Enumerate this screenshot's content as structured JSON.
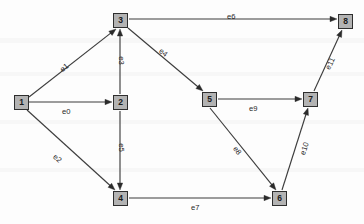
{
  "diagram": {
    "width": 364,
    "height": 224,
    "node_fill": "#b3b3b3",
    "node_stroke": "#2e2e2e",
    "edge_color": "#3d3d3d",
    "background": "#fdfdfd",
    "nodes": [
      {
        "id": "1",
        "label": "1",
        "x": 14,
        "y": 95
      },
      {
        "id": "2",
        "label": "2",
        "x": 113,
        "y": 95
      },
      {
        "id": "3",
        "label": "3",
        "x": 113,
        "y": 13
      },
      {
        "id": "4",
        "label": "4",
        "x": 113,
        "y": 191
      },
      {
        "id": "5",
        "label": "5",
        "x": 202,
        "y": 92
      },
      {
        "id": "6",
        "label": "6",
        "x": 272,
        "y": 191
      },
      {
        "id": "7",
        "label": "7",
        "x": 303,
        "y": 92
      },
      {
        "id": "8",
        "label": "8",
        "x": 338,
        "y": 14
      }
    ],
    "edges": [
      {
        "id": "e0",
        "label": "e0",
        "from": "1",
        "to": "2",
        "x1": 29,
        "y1": 102,
        "x2": 112,
        "y2": 102,
        "lx": 62,
        "ly": 107,
        "rot": 0
      },
      {
        "id": "e1",
        "label": "e1",
        "from": "1",
        "to": "3",
        "x1": 29,
        "y1": 97,
        "x2": 116,
        "y2": 29,
        "lx": 60,
        "ly": 63,
        "rot": -38
      },
      {
        "id": "e2",
        "label": "e2",
        "from": "1",
        "to": "4",
        "x1": 27,
        "y1": 110,
        "x2": 115,
        "y2": 190,
        "lx": 53,
        "ly": 154,
        "rot": 42
      },
      {
        "id": "e3",
        "label": "e3",
        "from": "2",
        "to": "3",
        "x1": 120,
        "y1": 94,
        "x2": 120,
        "y2": 29,
        "lx": 117,
        "ly": 56,
        "rot": 90
      },
      {
        "id": "e4",
        "label": "e4",
        "from": "3",
        "to": "5",
        "x1": 128,
        "y1": 28,
        "x2": 203,
        "y2": 91,
        "lx": 159,
        "ly": 48,
        "rot": 40
      },
      {
        "id": "e5",
        "label": "e5",
        "from": "2",
        "to": "4",
        "x1": 120,
        "y1": 111,
        "x2": 120,
        "y2": 190,
        "lx": 117,
        "ly": 143,
        "rot": 90
      },
      {
        "id": "e6",
        "label": "e6",
        "from": "3",
        "to": "8",
        "x1": 129,
        "y1": 19,
        "x2": 337,
        "y2": 19,
        "lx": 227,
        "ly": 12,
        "rot": 0
      },
      {
        "id": "e7",
        "label": "e7",
        "from": "4",
        "to": "6",
        "x1": 129,
        "y1": 198,
        "x2": 271,
        "y2": 198,
        "lx": 191,
        "ly": 203,
        "rot": 0
      },
      {
        "id": "e8",
        "label": "e8",
        "from": "5",
        "to": "6",
        "x1": 210,
        "y1": 108,
        "x2": 276,
        "y2": 190,
        "lx": 233,
        "ly": 146,
        "rot": 52
      },
      {
        "id": "e9",
        "label": "e9",
        "from": "5",
        "to": "7",
        "x1": 218,
        "y1": 99,
        "x2": 302,
        "y2": 99,
        "lx": 249,
        "ly": 104,
        "rot": 0
      },
      {
        "id": "e10",
        "label": "e10",
        "from": "6",
        "to": "7",
        "x1": 282,
        "y1": 190,
        "x2": 308,
        "y2": 108,
        "lx": 298,
        "ly": 144,
        "rot": -72
      },
      {
        "id": "e11",
        "label": "e11",
        "from": "7",
        "to": "8",
        "x1": 314,
        "y1": 91,
        "x2": 342,
        "y2": 30,
        "lx": 324,
        "ly": 59,
        "rot": -65
      }
    ]
  }
}
